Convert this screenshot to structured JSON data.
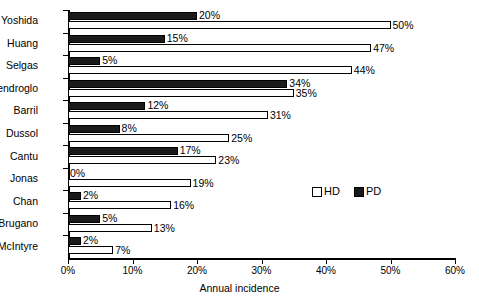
{
  "chart_data": {
    "type": "bar",
    "orientation": "horizontal",
    "title": "",
    "xlabel": "Annual incidence",
    "ylabel": "",
    "xlim": [
      0,
      60
    ],
    "xunit": "%",
    "grid": false,
    "legend_position": "inside-right",
    "xticks": [
      "0%",
      "10%",
      "20%",
      "30%",
      "40%",
      "50%",
      "60%"
    ],
    "xtick_values": [
      0,
      10,
      20,
      30,
      40,
      50,
      60
    ],
    "categories": [
      "Yoshida",
      "Huang",
      "Selgas",
      "Cendroglo",
      "Barril",
      "Dussol",
      "Cantu",
      "Jonas",
      "Chan",
      "Brugano",
      "McIntyre"
    ],
    "series": [
      {
        "name": "PD",
        "color": "#1a1a1a",
        "values": [
          20,
          15,
          5,
          34,
          12,
          8,
          17,
          0,
          2,
          5,
          2
        ],
        "labels": [
          "20%",
          "15%",
          "5%",
          "34%",
          "12%",
          "8%",
          "17%",
          "0%",
          "2%",
          "5%",
          "2%"
        ]
      },
      {
        "name": "HD",
        "color": "#ffffff",
        "values": [
          50,
          47,
          44,
          35,
          31,
          25,
          23,
          19,
          16,
          13,
          7
        ],
        "labels": [
          "50%",
          "47%",
          "44%",
          "35%",
          "31%",
          "25%",
          "23%",
          "19%",
          "16%",
          "13%",
          "7%"
        ]
      }
    ]
  },
  "legend": {
    "items": [
      {
        "label": "HD",
        "swatch": "white-square"
      },
      {
        "label": "PD",
        "swatch": "black-square"
      }
    ]
  },
  "caption": {
    "text": ""
  }
}
